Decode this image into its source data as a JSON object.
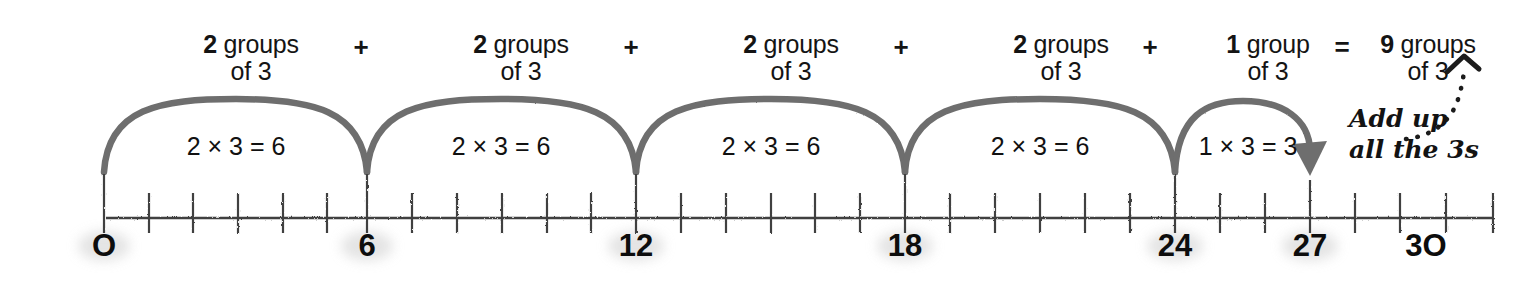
{
  "diagram": {
    "accent_color": "#6e6e6e",
    "text_color": "#141414",
    "line_color": "#3a3a3a"
  },
  "expression": {
    "terms": [
      {
        "count": "2",
        "groups_word": "groups",
        "of_line": "of 3"
      },
      {
        "count": "2",
        "groups_word": "groups",
        "of_line": "of 3"
      },
      {
        "count": "2",
        "groups_word": "groups",
        "of_line": "of 3"
      },
      {
        "count": "2",
        "groups_word": "groups",
        "of_line": "of 3"
      },
      {
        "count": "1",
        "groups_word": "group",
        "of_line": "of 3"
      }
    ],
    "operators": [
      "+",
      "+",
      "+",
      "+"
    ],
    "equals_sign": "=",
    "result": {
      "count": "9",
      "groups_word": "groups",
      "of_line": "of 3"
    }
  },
  "jumps": [
    {
      "label": "2 × 3 = 6",
      "from": 0,
      "to": 6,
      "multiplier": 2,
      "unit": 3,
      "product": 6,
      "arrow": false
    },
    {
      "label": "2 × 3 = 6",
      "from": 6,
      "to": 12,
      "multiplier": 2,
      "unit": 3,
      "product": 6,
      "arrow": false
    },
    {
      "label": "2 × 3 = 6",
      "from": 12,
      "to": 18,
      "multiplier": 2,
      "unit": 3,
      "product": 6,
      "arrow": false
    },
    {
      "label": "2 × 3 = 6",
      "from": 18,
      "to": 24,
      "multiplier": 2,
      "unit": 3,
      "product": 6,
      "arrow": false
    },
    {
      "label": "1 × 3 = 3",
      "from": 24,
      "to": 27,
      "multiplier": 1,
      "unit": 3,
      "product": 3,
      "arrow": true
    }
  ],
  "number_line": {
    "min": 0,
    "max": 30,
    "minor_step": 1,
    "major_step": 3,
    "labels": [
      "O",
      "6",
      "12",
      "18",
      "24",
      "27",
      "3O"
    ],
    "label_values": [
      0,
      6,
      12,
      18,
      24,
      27,
      30
    ]
  },
  "annotation": {
    "line1": "Add up",
    "line2": "all the 3s",
    "arrow": "dotted-curved-arrow-up-right"
  }
}
